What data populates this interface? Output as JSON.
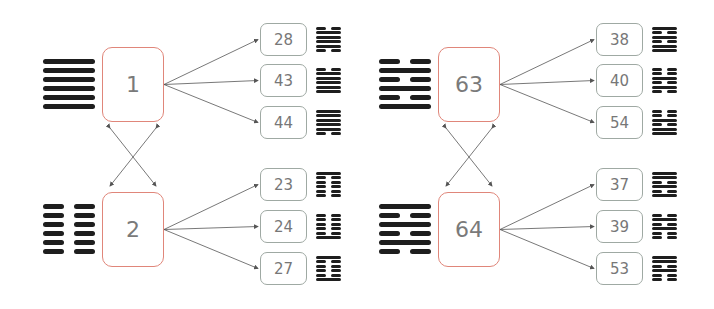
{
  "groups": [
    {
      "pair": [
        {
          "number": "1",
          "lines_top_to_bottom": [
            1,
            1,
            1,
            1,
            1,
            1
          ]
        },
        {
          "number": "2",
          "lines_top_to_bottom": [
            0,
            0,
            0,
            0,
            0,
            0
          ]
        }
      ],
      "targets": [
        [
          {
            "number": "28",
            "lines_top_to_bottom": [
              0,
              1,
              1,
              1,
              1,
              0
            ]
          },
          {
            "number": "43",
            "lines_top_to_bottom": [
              0,
              1,
              1,
              1,
              1,
              1
            ]
          },
          {
            "number": "44",
            "lines_top_to_bottom": [
              1,
              1,
              1,
              1,
              1,
              0
            ]
          }
        ],
        [
          {
            "number": "23",
            "lines_top_to_bottom": [
              1,
              0,
              0,
              0,
              0,
              0
            ]
          },
          {
            "number": "24",
            "lines_top_to_bottom": [
              0,
              0,
              0,
              0,
              0,
              1
            ]
          },
          {
            "number": "27",
            "lines_top_to_bottom": [
              1,
              0,
              0,
              0,
              0,
              1
            ]
          }
        ]
      ]
    },
    {
      "pair": [
        {
          "number": "63",
          "lines_top_to_bottom": [
            0,
            1,
            0,
            1,
            0,
            1
          ]
        },
        {
          "number": "64",
          "lines_top_to_bottom": [
            1,
            0,
            1,
            0,
            1,
            0
          ]
        }
      ],
      "targets": [
        [
          {
            "number": "38",
            "lines_top_to_bottom": [
              1,
              0,
              1,
              0,
              1,
              1
            ]
          },
          {
            "number": "40",
            "lines_top_to_bottom": [
              0,
              0,
              1,
              0,
              1,
              0
            ]
          },
          {
            "number": "54",
            "lines_top_to_bottom": [
              0,
              0,
              1,
              0,
              1,
              1
            ]
          }
        ],
        [
          {
            "number": "37",
            "lines_top_to_bottom": [
              1,
              1,
              0,
              1,
              0,
              1
            ]
          },
          {
            "number": "39",
            "lines_top_to_bottom": [
              0,
              1,
              0,
              1,
              0,
              0
            ]
          },
          {
            "number": "53",
            "lines_top_to_bottom": [
              1,
              1,
              0,
              1,
              0,
              0
            ]
          }
        ]
      ]
    }
  ],
  "colors": {
    "main_box_border": "#e0867a",
    "sub_box_border": "#9fa9a3",
    "line_color": "#1e1e1e",
    "arrow_color": "#555555"
  }
}
